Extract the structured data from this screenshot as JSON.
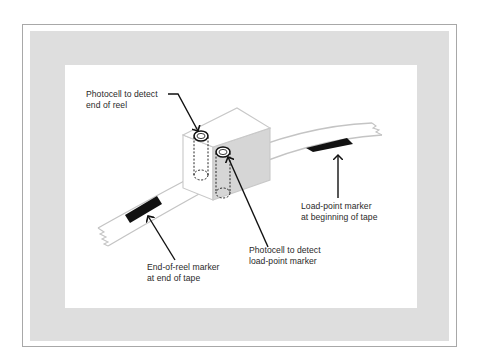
{
  "figure": {
    "type": "schematic",
    "colors": {
      "frame_border": "#a8a8a8",
      "band": "#dedede",
      "panel": "#ffffff",
      "tape_outline": "#c8c8c8",
      "marker": "#111111",
      "cube_shade": "#d6d6d6",
      "leader_line": "#111111",
      "text": "#2a2a2a"
    }
  },
  "labels": {
    "photocell_end_of_reel": {
      "line1": "Photocell to detect",
      "line2": "end of reel"
    },
    "photocell_load_point": {
      "line1": "Photocell to detect",
      "line2": "load-point marker"
    },
    "load_point_marker": {
      "line1": "Load-point marker",
      "line2": "at beginning of tape"
    },
    "end_of_reel_marker": {
      "line1": "End-of-reel marker",
      "line2": "at end of tape"
    }
  }
}
